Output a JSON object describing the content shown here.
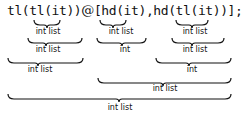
{
  "expression": {
    "parts": [
      "tl(tl(",
      "it",
      "))",
      "@",
      "[hd(",
      "it",
      "),",
      "hd(tl(",
      "it",
      "))];"
    ]
  },
  "annotations": [
    {
      "level": 1,
      "label": "int list",
      "spans": "it"
    },
    {
      "level": 1,
      "label": "int list",
      "spans": "it"
    },
    {
      "level": 1,
      "label": "int list",
      "spans": "it"
    },
    {
      "level": 2,
      "label": "int list",
      "spans": "tl(it)"
    },
    {
      "level": 2,
      "label": "int",
      "spans": "hd(it)"
    },
    {
      "level": 2,
      "label": "int list",
      "spans": "tl(it)"
    },
    {
      "level": 3,
      "label": "int list",
      "spans": "tl(tl(it))"
    },
    {
      "level": 3,
      "label": "int",
      "spans": "hd(tl(it))"
    },
    {
      "level": 4,
      "label": "int list",
      "spans": "[hd(it), hd(tl(it))]"
    },
    {
      "level": 5,
      "label": "int list",
      "spans": "tl(tl(it)) @ [hd(it), hd(tl(it))]"
    }
  ]
}
